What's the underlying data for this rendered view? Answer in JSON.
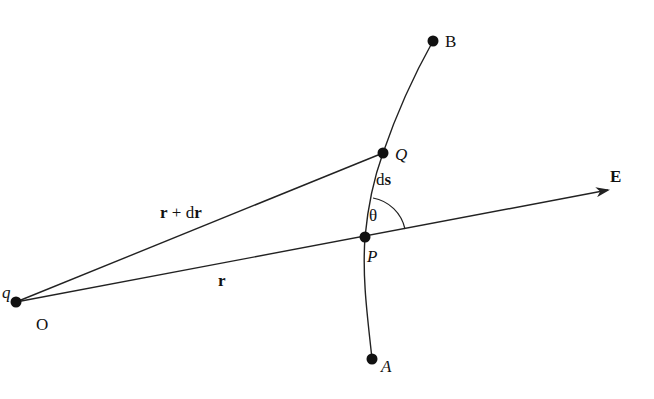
{
  "diagram": {
    "colors": {
      "stroke": "#222222",
      "text": "#111111",
      "background": "#ffffff"
    },
    "points": [
      {
        "id": "O",
        "label": "O",
        "x": 16,
        "y": 302,
        "label_x": 36,
        "label_y": 330,
        "style": "normal"
      },
      {
        "id": "P",
        "label": "P",
        "x": 365,
        "y": 237,
        "label_x": 367,
        "label_y": 262,
        "style": "italic"
      },
      {
        "id": "Q",
        "label": "Q",
        "x": 383,
        "y": 153,
        "label_x": 395,
        "label_y": 160,
        "style": "italic"
      },
      {
        "id": "B",
        "label": "B",
        "x": 433,
        "y": 41,
        "label_x": 445,
        "label_y": 47,
        "style": "normal"
      },
      {
        "id": "A",
        "label": "A",
        "x": 372,
        "y": 359,
        "label_x": 381,
        "label_y": 372,
        "style": "italic"
      }
    ],
    "charge_label": {
      "text": "q",
      "x": 2,
      "y": 298
    },
    "vectors": {
      "r": {
        "label": "r",
        "label_x": 218,
        "label_y": 286
      },
      "r_plus_dr": {
        "label_main": "r",
        "label_plus": " + d",
        "label_end": "r",
        "label_x": 160,
        "label_y": 218
      },
      "ds": {
        "label_d": "d",
        "label_s": "s",
        "label_x": 376,
        "label_y": 185
      },
      "E": {
        "label": "E",
        "label_x": 610,
        "label_y": 182
      }
    },
    "angle": {
      "label": "θ",
      "label_x": 369,
      "label_y": 221
    }
  }
}
